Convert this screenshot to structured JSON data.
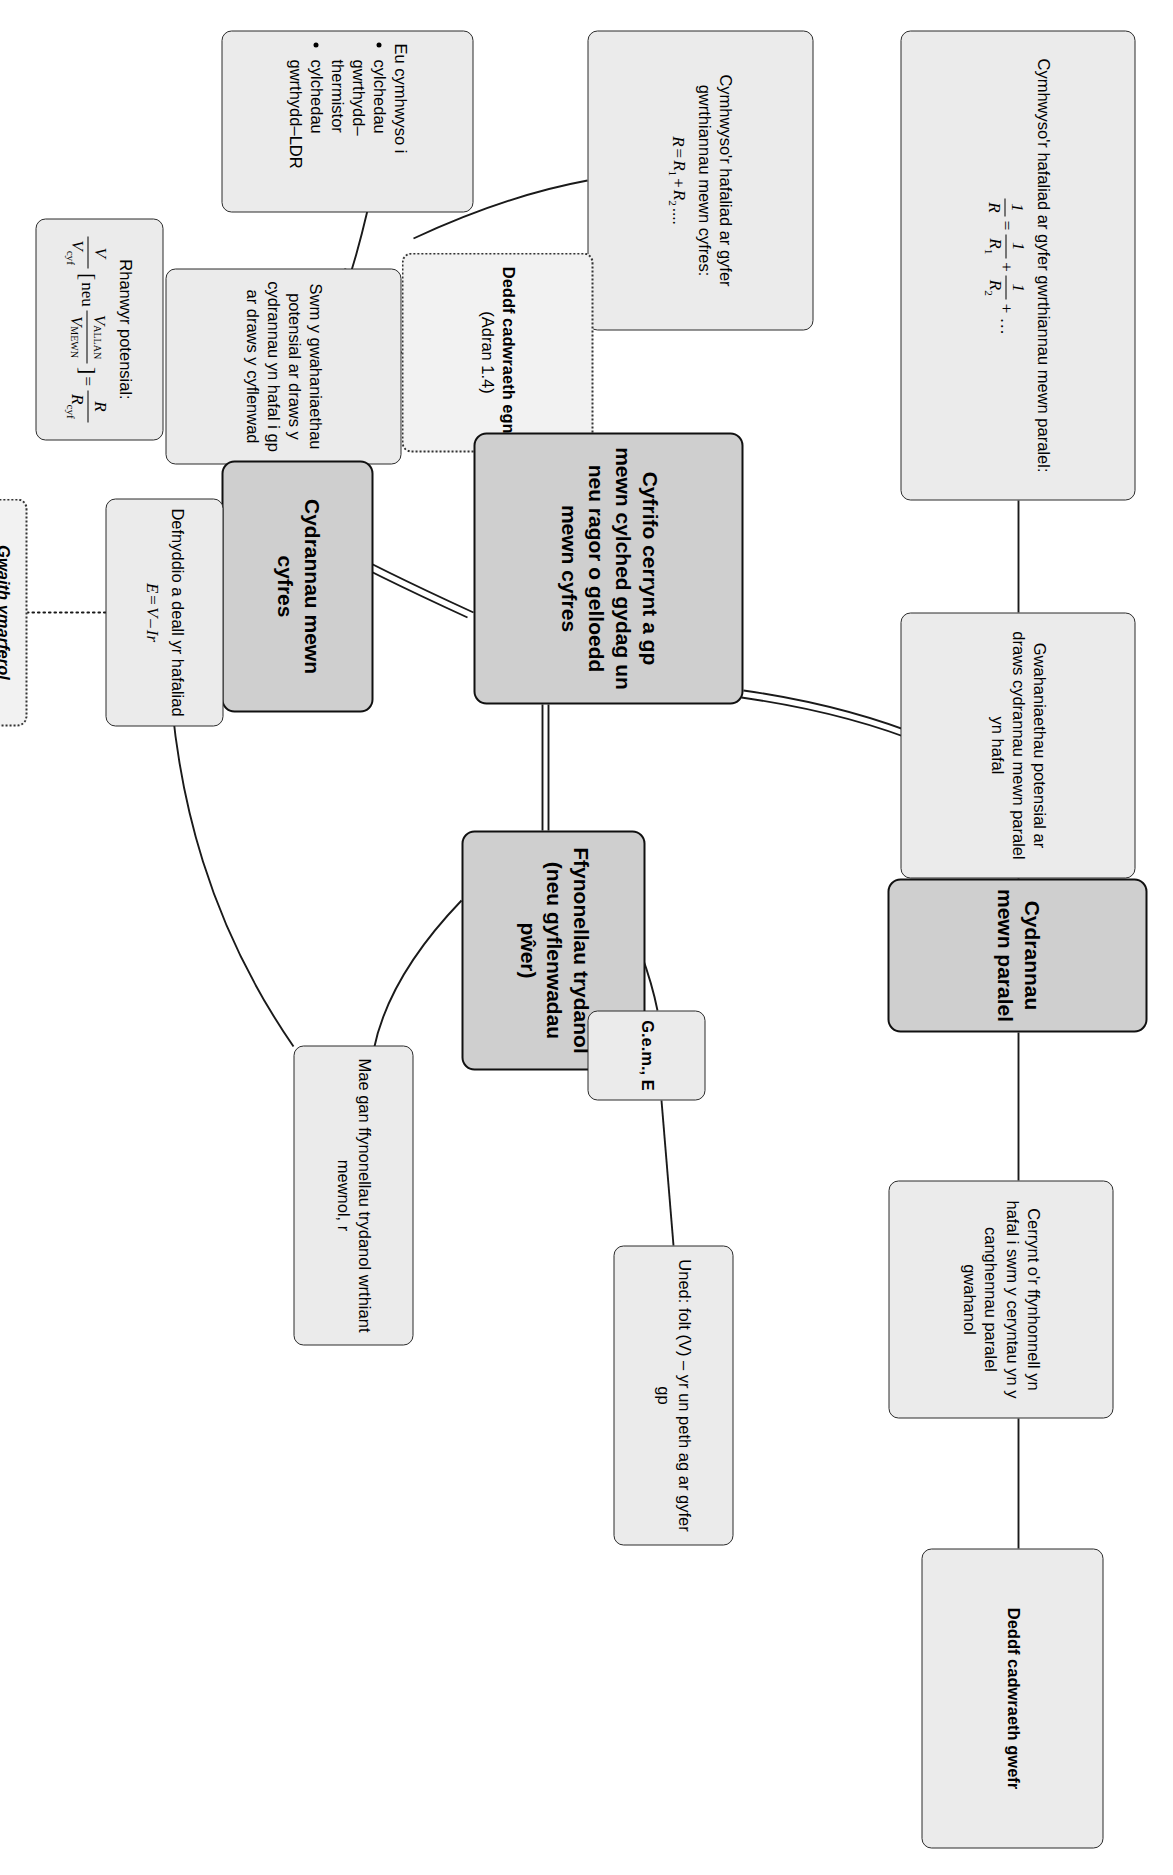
{
  "diagram": {
    "title": "Cydrannau mewn paralel",
    "language": "cy",
    "nodes": {
      "cydrannau_paralel": "Cydrannau mewn paralel",
      "deddf_gwefr": "Deddf cadwraeth gwefr",
      "cerrynt_ffynhonnell": "Cerrynt o'r ffynhonnell yn hafal i swm y ceryntau yn y canghennau paralel gwahanol",
      "gwahaniaethau_paralel": "Gwahaniaethau potensial ar draws cydrannau mewn paralel yn hafal",
      "hafaliad_paralel_label": "Cymhwyso'r hafaliad ar gyfer gwrthiannau mewn paralel:",
      "cyfrifo_canolog": "Cyfrifo cerrynt a gp mewn cylched gydag un neu ragor o gelloedd mewn cyfres",
      "ffynonellau": "Ffynonellau trydanol (neu gyflenwadau pŵer)",
      "gem": "G.e.m., E",
      "uned_folt": "Uned: folt (V) – yr un peth ag ar gyfer gp",
      "mae_gan": "Mae gan ffynonellau trydanol wrthiant mewnol, r",
      "deddf_egni_title": "Deddf cadwraeth egni",
      "deddf_egni_sub": "(Adran 1.4)",
      "cydrannau_cyfres": "Cydrannau mewn cyfres",
      "swm_gwahaniaethau": "Swm y gwahaniaethau potensial ar draws y cydrannau yn hafal i gp ar draws y cyflenwad",
      "hafaliad_cyfres_label": "Cymhwyso'r hafaliad ar gyfer gwrthiannau mewn cyfres:",
      "hafaliad_cyfres_formula": "R = R₁ + R₂....",
      "defnyddio_label": "Defnyddio a deall yr hafaliad",
      "defnyddio_formula": "E = V – Ir",
      "gwaith_title": "Gwaith ymarferol penodol:",
      "gwaith_body": "Darganfod gwrthiant mewnol cell",
      "rhanwyr_label": "Rhanwyr potensial:",
      "eu_cymhwyso_intro": "Eu cymhwyso i",
      "eu_cymhwyso_items": [
        "cylchedau gwrthydd–thermistor",
        "cylchedau gwrthydd–LDR"
      ]
    },
    "formulas": {
      "paralel": "1/R = 1/R₁ + 1/R₂ + …",
      "cyfres": "R = R₁ + R₂....",
      "emf": "E = V – Ir",
      "rhanwyr": "V/V_cyf [neu V_ALLAN/V_MEWN] = R/R_cyf"
    },
    "colors": {
      "header_fill": "#cfcfcf",
      "node_fill": "#ebebeb",
      "dotted_fill": "#f2f2f2",
      "stroke": "#1a1a1a"
    }
  }
}
